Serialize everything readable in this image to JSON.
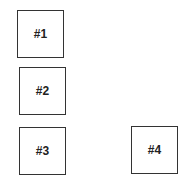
{
  "diagram": {
    "boxes": [
      {
        "label": "#1"
      },
      {
        "label": "#2"
      },
      {
        "label": "#3"
      },
      {
        "label": "#4"
      }
    ]
  }
}
